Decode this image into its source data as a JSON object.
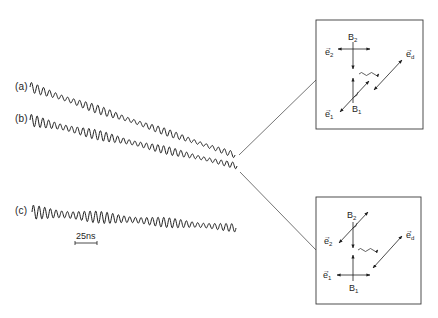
{
  "traces": [
    {
      "id": "a",
      "label": "(a)",
      "x_start": 30,
      "y_start": 87,
      "x_end": 235,
      "y_end": 155,
      "cycles": 34,
      "amp_start": 5,
      "amp_end": 3
    },
    {
      "id": "b",
      "label": "(b)",
      "x_start": 30,
      "y_start": 120,
      "x_end": 237,
      "y_end": 166,
      "cycles": 36,
      "amp_start": 6,
      "amp_end": 3
    },
    {
      "id": "c",
      "label": "(c)",
      "x_start": 32,
      "y_start": 212,
      "x_end": 236,
      "y_end": 228,
      "cycles": 36,
      "amp_start": 7,
      "amp_end": 4
    }
  ],
  "scale_bar": {
    "label": "25ns",
    "x1": 75,
    "x2": 97,
    "y": 243
  },
  "connectors": [
    {
      "x1": 239,
      "y1": 155,
      "x2": 316,
      "y2": 80
    },
    {
      "x1": 240,
      "y1": 172,
      "x2": 316,
      "y2": 250
    }
  ],
  "boxes": [
    {
      "id": "top",
      "x": 316,
      "y": 20,
      "w": 107,
      "h": 109,
      "labels": {
        "b2": "B",
        "b2_sub": "2",
        "b1": "B",
        "b1_sub": "1",
        "e2": "e",
        "e2_sub": "2",
        "e1": "e",
        "e1_sub": "1",
        "ed": "e",
        "ed_sub": "d"
      },
      "b2_orientation": "horizontal",
      "b1_orientation": "diagonal"
    },
    {
      "id": "bottom",
      "x": 316,
      "y": 197,
      "w": 105,
      "h": 107,
      "labels": {
        "b2": "B",
        "b2_sub": "2",
        "b1": "B",
        "b1_sub": "1",
        "e2": "e",
        "e2_sub": "2",
        "e1": "e",
        "e1_sub": "1",
        "ed": "e",
        "ed_sub": "d"
      },
      "b2_orientation": "diagonal",
      "b1_orientation": "horizontal"
    }
  ],
  "colors": {
    "ink": "#1e1e1e",
    "thin_line": "#3a3a3a",
    "background": "#ffffff"
  }
}
